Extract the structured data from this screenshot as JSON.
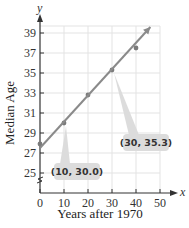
{
  "chart_data": {
    "type": "scatter",
    "title": "",
    "xlabel": "Years after 1970",
    "ylabel": "Median Age",
    "x_axis_var": "x",
    "y_axis_var": "y",
    "xlim": [
      0,
      50
    ],
    "ylim": [
      23,
      40
    ],
    "x_ticks": [
      0,
      10,
      20,
      30,
      40,
      50
    ],
    "y_ticks": [
      25,
      27,
      29,
      31,
      33,
      35,
      37,
      39
    ],
    "y_axis_break": true,
    "grid": true,
    "series": [
      {
        "name": "Median age data",
        "type": "scatter",
        "points": [
          {
            "x": 0,
            "y": 27.9
          },
          {
            "x": 10,
            "y": 30.0
          },
          {
            "x": 20,
            "y": 32.8
          },
          {
            "x": 30,
            "y": 35.3
          },
          {
            "x": 40,
            "y": 37.5
          }
        ]
      },
      {
        "name": "Line of fit",
        "type": "line",
        "points": [
          {
            "x": 0,
            "y": 27.5
          },
          {
            "x": 46,
            "y": 39.6
          }
        ]
      }
    ],
    "annotations": [
      {
        "label": "(10, 30.0)",
        "x": 10,
        "y": 30.0
      },
      {
        "label": "(30, 35.3)",
        "x": 30,
        "y": 35.3
      }
    ],
    "colors": {
      "line": "#8a8a8a",
      "points": "#7a7a7a",
      "grid": "#e3e3e3",
      "axis": "#333333",
      "callout_bg": "#dcdcdc"
    }
  }
}
